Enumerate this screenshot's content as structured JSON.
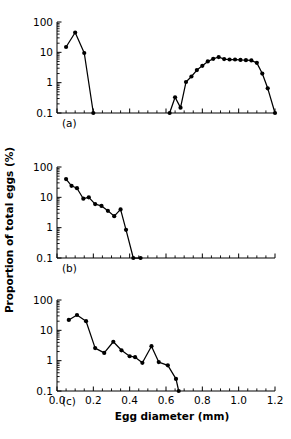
{
  "figure": {
    "xlabel": "Egg diameter (mm)",
    "ylabel": "Proportion of total eggs (%)",
    "x_ticks": [
      "0.0",
      "0.2",
      "0.4",
      "0.6",
      "0.8",
      "1.0",
      "1.2"
    ],
    "y_ticks": [
      "100",
      "10",
      "1",
      "0.1"
    ],
    "panels": [
      {
        "id": "a",
        "label": "(a)"
      },
      {
        "id": "b",
        "label": "(b)"
      },
      {
        "id": "c",
        "label": "(c)"
      }
    ]
  },
  "chart_data": [
    {
      "type": "line",
      "title": "(a)",
      "xlabel": "Egg diameter (mm)",
      "ylabel": "Proportion of total eggs (%)",
      "xlim": [
        0.0,
        1.2
      ],
      "ylim": [
        0.1,
        100
      ],
      "yscale": "log",
      "grid": false,
      "legend": null,
      "segments": [
        {
          "name": "small-egg mode",
          "x": [
            0.05,
            0.1,
            0.15,
            0.2
          ],
          "y": [
            15,
            45,
            9.5,
            0.1
          ]
        },
        {
          "name": "large-egg mode",
          "x": [
            0.62,
            0.65,
            0.68,
            0.71,
            0.74,
            0.77,
            0.8,
            0.83,
            0.86,
            0.89,
            0.92,
            0.95,
            0.98,
            1.01,
            1.04,
            1.07,
            1.1,
            1.13,
            1.16,
            1.2
          ],
          "y": [
            0.1,
            0.33,
            0.15,
            1.05,
            1.6,
            2.6,
            3.6,
            5.0,
            6.1,
            7.0,
            6.0,
            5.8,
            5.8,
            5.6,
            5.5,
            5.4,
            4.5,
            2.0,
            0.65,
            0.1
          ]
        }
      ]
    },
    {
      "type": "line",
      "title": "(b)",
      "xlabel": "Egg diameter (mm)",
      "ylabel": "Proportion of total eggs (%)",
      "xlim": [
        0.0,
        1.2
      ],
      "ylim": [
        0.1,
        100
      ],
      "yscale": "log",
      "grid": false,
      "legend": null,
      "segments": [
        {
          "name": "egg size distribution",
          "x": [
            0.05,
            0.08,
            0.11,
            0.145,
            0.175,
            0.21,
            0.245,
            0.28,
            0.315,
            0.35,
            0.38,
            0.42,
            0.46
          ],
          "y": [
            40,
            24,
            20,
            9.0,
            10.0,
            6.0,
            5.2,
            3.6,
            2.4,
            4.0,
            0.85,
            0.1,
            0.1
          ]
        }
      ]
    },
    {
      "type": "line",
      "title": "(c)",
      "xlabel": "Egg diameter (mm)",
      "ylabel": "Proportion of total eggs (%)",
      "xlim": [
        0.0,
        1.2
      ],
      "ylim": [
        0.1,
        100
      ],
      "yscale": "log",
      "grid": false,
      "legend": null,
      "segments": [
        {
          "name": "egg size distribution",
          "x": [
            0.065,
            0.11,
            0.16,
            0.21,
            0.26,
            0.31,
            0.355,
            0.4,
            0.43,
            0.47,
            0.52,
            0.56,
            0.61,
            0.655,
            0.67
          ],
          "y": [
            22,
            32,
            20,
            2.6,
            1.8,
            4.2,
            2.2,
            1.4,
            1.3,
            0.85,
            3.0,
            0.9,
            0.7,
            0.25,
            0.1
          ]
        }
      ]
    }
  ]
}
